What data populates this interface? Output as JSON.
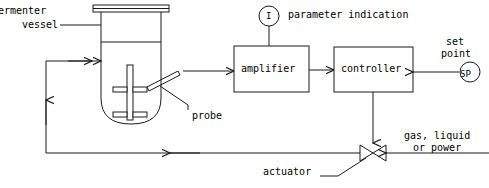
{
  "diagram": {
    "type": "process-control-flow-diagram",
    "stroke_color": "#1a1a1a",
    "background_color": "#ffffff",
    "labels": {
      "fermenter_vessel_line1": "ermenter",
      "fermenter_vessel_line2": "vessel",
      "parameter_indication": "parameter indication",
      "set_point_line1": "set",
      "set_point_line2": "point",
      "amplifier": "amplifier",
      "controller": "controller",
      "probe": "probe",
      "gas_line1": "gas, liquid",
      "gas_line2": "or power",
      "actuator": "actuator"
    },
    "symbols": {
      "indicator_letter": "I",
      "setpoint_letters": "SP"
    },
    "components": [
      {
        "name": "fermenter-vessel",
        "label": "ermenter vessel"
      },
      {
        "name": "probe",
        "label": "probe"
      },
      {
        "name": "amplifier",
        "label": "amplifier"
      },
      {
        "name": "controller",
        "label": "controller"
      },
      {
        "name": "parameter-indicator",
        "label": "I"
      },
      {
        "name": "set-point",
        "label": "SP"
      },
      {
        "name": "actuator-valve",
        "label": "actuator"
      },
      {
        "name": "utility-supply",
        "label": "gas, liquid or power"
      }
    ]
  }
}
